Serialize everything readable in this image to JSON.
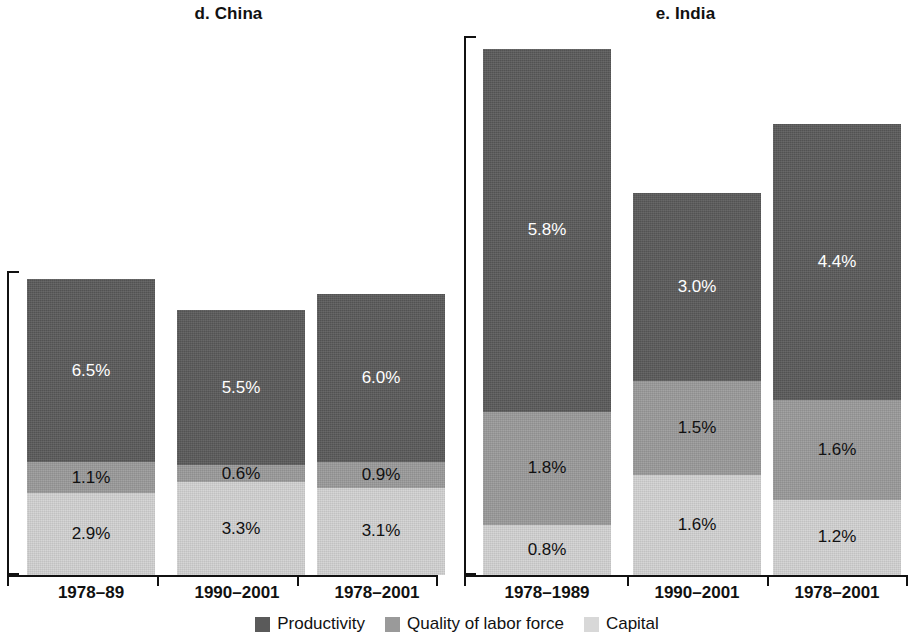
{
  "chart_data": {
    "type": "bar",
    "subtype": "stacked-bar",
    "title": "",
    "panels": [
      {
        "key": "china",
        "title": "d. China",
        "xlabel": "",
        "ylabel": "",
        "ylim": [
          0,
          10.8
        ],
        "grid": false,
        "categories": [
          "1978–89",
          "1990–2001",
          "1978–2001"
        ],
        "series": [
          {
            "name": "Productivity",
            "color": "#5a5a5a",
            "values": [
              6.5,
              5.5,
              6.0
            ],
            "labels": [
              "6.5%",
              "5.5%",
              "6.0%"
            ]
          },
          {
            "name": "Quality of labor force",
            "color": "#9a9a9a",
            "values": [
              1.1,
              0.6,
              0.9
            ],
            "labels": [
              "1.1%",
              "0.6%",
              "0.9%"
            ]
          },
          {
            "name": "Capital",
            "color": "#d2d2d2",
            "values": [
              2.9,
              3.3,
              3.1
            ],
            "labels": [
              "2.9%",
              "3.3%",
              "3.1%"
            ]
          }
        ],
        "totals": [
          10.5,
          9.4,
          10.0
        ]
      },
      {
        "key": "india",
        "title": "e. India",
        "xlabel": "",
        "ylabel": "",
        "ylim": [
          0,
          8.6
        ],
        "grid": false,
        "categories": [
          "1978–1989",
          "1990–2001",
          "1978–2001"
        ],
        "series": [
          {
            "name": "Productivity",
            "color": "#5a5a5a",
            "values": [
              5.8,
              3.0,
              4.4
            ],
            "labels": [
              "5.8%",
              "3.0%",
              "4.4%"
            ]
          },
          {
            "name": "Quality of labor force",
            "color": "#9a9a9a",
            "values": [
              1.8,
              1.5,
              1.6
            ],
            "labels": [
              "1.8%",
              "1.5%",
              "1.6%"
            ]
          },
          {
            "name": "Capital",
            "color": "#d2d2d2",
            "values": [
              0.8,
              1.6,
              1.2
            ],
            "labels": [
              "0.8%",
              "1.6%",
              "1.2%"
            ]
          }
        ],
        "totals": [
          8.4,
          6.1,
          7.2
        ]
      }
    ],
    "legend": {
      "position": "bottom",
      "entries": [
        {
          "label": "Productivity",
          "color": "#5a5a5a"
        },
        {
          "label": "Quality of labor force",
          "color": "#9a9a9a"
        },
        {
          "label": "Capital",
          "color": "#d8d8d8"
        }
      ]
    }
  }
}
